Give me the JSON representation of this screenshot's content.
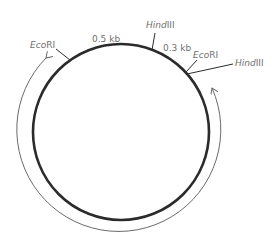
{
  "diagram": {
    "type": "plasmid-restriction-map",
    "colors": {
      "plasmid": "#2b2b2b",
      "arrow": "#6a6a6a",
      "label": "#6f6f6f",
      "background": "#ffffff"
    },
    "sites": [
      {
        "enzyme_prefix": "Eco",
        "enzyme_suffix": "RI",
        "position": "upper-left"
      },
      {
        "enzyme_prefix": "Hind",
        "enzyme_suffix": "III",
        "position": "top"
      },
      {
        "enzyme_prefix": "Eco",
        "enzyme_suffix": "RI",
        "position": "upper-right"
      },
      {
        "enzyme_prefix": "Hind",
        "enzyme_suffix": "III",
        "position": "right"
      }
    ],
    "fragments": [
      {
        "label": "0.5 kb",
        "between": "EcoRI (left) – HindIII (top)"
      },
      {
        "label": "0.3 kb",
        "between": "HindIII (top) – EcoRI (right)"
      }
    ],
    "arrow": {
      "direction": "both ends",
      "description": "outer arc spanning the large remaining fragment"
    }
  }
}
